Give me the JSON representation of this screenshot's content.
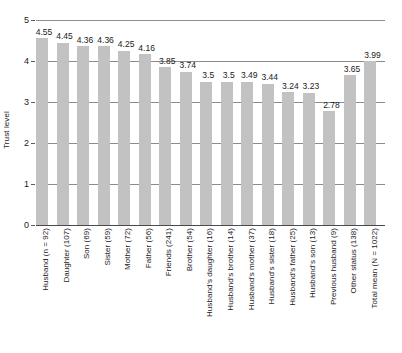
{
  "chart_data": {
    "type": "bar",
    "title": "",
    "subtitle": "",
    "xlabel": "",
    "ylabel": "Trust level",
    "ylim": [
      0,
      5
    ],
    "yticks": [
      0,
      1,
      2,
      3,
      4,
      5
    ],
    "ytick_labels": [
      "0",
      "1",
      "2",
      "3",
      "4",
      "5"
    ],
    "grid": true,
    "legend": false,
    "bar_color": "#c2c2c2",
    "categories": [
      "Husband (n = 92)",
      "Daughter (107)",
      "Son (69)",
      "Sister (59)",
      "Mother (72)",
      "Father (56)",
      "Friends (241)",
      "Brother (54)",
      "Husband's daughter (16)",
      "Husband's brother (14)",
      "Husband's mother (37)",
      "Husband's sister (18)",
      "Husband's father (25)",
      "Husband's son (13)",
      "Previous husband (9)",
      "Other status (138)",
      "Total mean (N = 1022)"
    ],
    "values": [
      4.55,
      4.45,
      4.36,
      4.36,
      4.25,
      4.16,
      3.85,
      3.74,
      3.5,
      3.5,
      3.49,
      3.44,
      3.24,
      3.23,
      2.78,
      3.65,
      3.99
    ],
    "value_labels": [
      "4.55",
      "4.45",
      "4.36",
      "4.36",
      "4.25",
      "4.16",
      "3.85",
      "3.74",
      "3.5",
      "3.5",
      "3.49",
      "3.44",
      "3.24",
      "3.23",
      "2.78",
      "3.65",
      "3.99"
    ]
  }
}
